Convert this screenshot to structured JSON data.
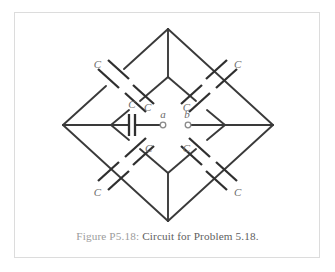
{
  "figure": {
    "caption_label": "Figure P5.18:",
    "caption_text": "Circuit for Problem 5.18.",
    "frame_color": "#dcdcdc",
    "background": "#ffffff",
    "wire_color": "#3a3a3a",
    "label_color": "#6d6d6d"
  },
  "circuit": {
    "type": "capacitor-bridge-network",
    "terminals": [
      {
        "id": "a",
        "label": "a",
        "x": 163,
        "y": 118
      },
      {
        "id": "b",
        "label": "b",
        "x": 186,
        "y": 118
      }
    ],
    "capacitors": [
      {
        "id": "cap-outer-top-left",
        "label": "C",
        "label_x": 101,
        "label_y": 68,
        "label_anchor": "end"
      },
      {
        "id": "cap-inner-top-left",
        "label": "C",
        "label_x": 144,
        "label_y": 111,
        "label_anchor": "start"
      },
      {
        "id": "cap-outer-top-right",
        "label": "C",
        "label_x": 234,
        "label_y": 68,
        "label_anchor": "start"
      },
      {
        "id": "cap-inner-top-right",
        "label": "C",
        "label_x": 190,
        "label_y": 111,
        "label_anchor": "end"
      },
      {
        "id": "cap-center-left",
        "label": "C",
        "label_x": 132,
        "label_y": 108,
        "label_anchor": "middle"
      },
      {
        "id": "cap-inner-bottom-left",
        "label": "C",
        "label_x": 145,
        "label_y": 152,
        "label_anchor": "start"
      },
      {
        "id": "cap-outer-bottom-left",
        "label": "C",
        "label_x": 101,
        "label_y": 196,
        "label_anchor": "end"
      },
      {
        "id": "cap-inner-bottom-right",
        "label": "C",
        "label_x": 190,
        "label_y": 152,
        "label_anchor": "end"
      },
      {
        "id": "cap-outer-bottom-right",
        "label": "C",
        "label_x": 234,
        "label_y": 196,
        "label_anchor": "start"
      }
    ],
    "labels_count": 8,
    "vertices": {
      "outer_top": {
        "x": 168,
        "y": 29
      },
      "outer_right": {
        "x": 273,
        "y": 125
      },
      "outer_bottom": {
        "x": 168,
        "y": 221
      },
      "outer_left": {
        "x": 63,
        "y": 125
      },
      "inner_top": {
        "x": 168,
        "y": 77
      },
      "inner_right": {
        "x": 225,
        "y": 125
      },
      "inner_bottom": {
        "x": 168,
        "y": 173
      },
      "inner_left": {
        "x": 111,
        "y": 125
      }
    }
  }
}
